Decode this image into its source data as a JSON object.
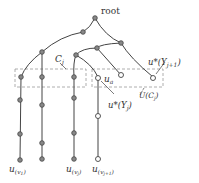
{
  "diagram": {
    "colors": {
      "edge": "#444444",
      "node_fill": "#888888",
      "node_stroke": "#444444",
      "hollow_fill": "#ffffff",
      "dash": "#999999",
      "text": "#333333"
    },
    "labels": {
      "root": "root",
      "cj": "C",
      "cj_sub": "j",
      "ua": "u",
      "ua_sub": "a",
      "u_star_yj1": "u*(Y",
      "u_star_yj1_sub": "j+1",
      "u_star_yj1_end": ")",
      "u_cj": "U(C",
      "u_cj_sub": "j",
      "u_cj_end": ")",
      "u_star_yj": "u*(Y",
      "u_star_yj_sub": "j",
      "u_star_yj_end": ")",
      "leaf_v1": "u",
      "leaf_v1_sub": "(v",
      "leaf_v1_subsub": "1",
      "leaf_v1_end": ")",
      "leaf_vj": "u",
      "leaf_vj_sub": "(v",
      "leaf_vj_subsub": "j",
      "leaf_vj_end": ")",
      "leaf_vj1": "u",
      "leaf_vj1_sub": "(v",
      "leaf_vj1_subsub": "j+1",
      "leaf_vj1_end": ")"
    }
  }
}
